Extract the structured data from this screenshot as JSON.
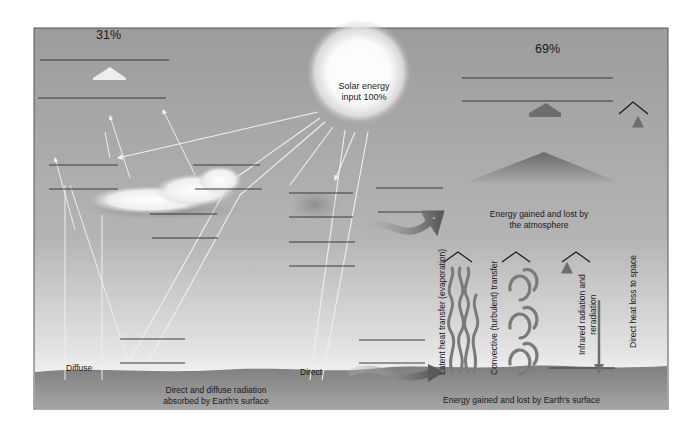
{
  "labels": {
    "reflected_pct": "31%",
    "absorbed_pct": "69%",
    "sun": "Solar energy\ninput 100%",
    "atmosphere": "Energy gained and lost by\nthe atmosphere",
    "diffuse": "Diffuse",
    "direct": "Direct",
    "surface_absorbed": "Direct and diffuse radiation\nabsorbed by Earth's surface",
    "surface_energy": "Energy gained and lost by Earth's surface",
    "latent": "Latent heat transfer (evaporation)",
    "convective": "Convective (turbulent) transfer",
    "infrared": "Infrared radiation and\nreradiation",
    "direct_loss": "Direct heat loss to space"
  },
  "colors": {
    "sky_top": "#9e9e9e",
    "sky_bottom": "#f4f4f4",
    "ground": "#8a8a8a",
    "frame": "#555555",
    "blank_line": "#3a3a3a",
    "ray": "#f2f2f2",
    "arrow_dark": "#6e6e6e"
  },
  "blank_lines_count": 24
}
